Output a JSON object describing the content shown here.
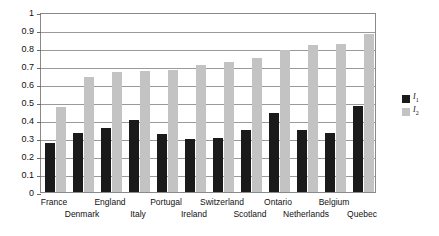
{
  "chart_data": {
    "type": "bar",
    "title": "",
    "subtitle": "",
    "xlabel": "",
    "ylabel": "",
    "ylim": [
      0,
      1
    ],
    "ytick_labels": [
      "1",
      "0.9",
      "0.8",
      "0.7",
      "0.6",
      "0.5",
      "0.4",
      "0.3",
      "0.2",
      "0.1",
      "0"
    ],
    "ytick_values": [
      1,
      0.9,
      0.8,
      0.7,
      0.6,
      0.5,
      0.4,
      0.3,
      0.2,
      0.1,
      0
    ],
    "grid": "horizontal",
    "legend_position": "right",
    "categories": [
      "France",
      "Denmark",
      "England",
      "Italy",
      "Portugal",
      "Ireland",
      "Switzerland",
      "Scotland",
      "Ontario",
      "Netherlands",
      "Belgium",
      "Quebec"
    ],
    "category_label_rows": [
      0,
      1,
      0,
      1,
      0,
      1,
      0,
      1,
      0,
      1,
      0,
      1
    ],
    "series": [
      {
        "name": "I1",
        "legend_label": "I",
        "legend_subscript": "1",
        "color": "#1a1a1a",
        "values": [
          0.27,
          0.33,
          0.355,
          0.4,
          0.325,
          0.295,
          0.3,
          0.345,
          0.44,
          0.345,
          0.33,
          0.48
        ]
      },
      {
        "name": "I2",
        "legend_label": "I",
        "legend_subscript": "2",
        "color": "#c3c3c3",
        "values": [
          0.47,
          0.64,
          0.665,
          0.675,
          0.68,
          0.705,
          0.72,
          0.745,
          0.79,
          0.815,
          0.825,
          0.88
        ]
      }
    ]
  },
  "legend": {
    "items": [
      {
        "label": "I",
        "subscript": "1",
        "color": "#1a1a1a"
      },
      {
        "label": "I",
        "subscript": "2",
        "color": "#c3c3c3"
      }
    ]
  },
  "colors": {
    "series_1": "#1a1a1a",
    "series_2": "#c3c3c3",
    "grid": "#9a9a9a",
    "frame": "#8a8a8a",
    "background": "#ffffff",
    "text": "#111111"
  }
}
